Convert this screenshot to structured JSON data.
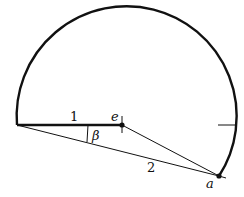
{
  "diagram": {
    "labels": {
      "segment_1": "1",
      "segment_2": "2",
      "angle": "β",
      "center_point": "e",
      "arc_point": "a"
    },
    "colors": {
      "stroke": "#111111",
      "background": "#ffffff"
    }
  }
}
